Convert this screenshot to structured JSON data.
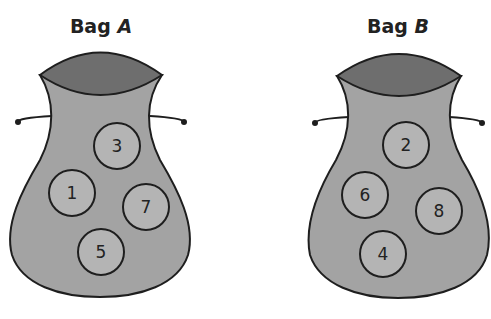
{
  "bags": [
    {
      "label_prefix": "Bag",
      "label_letter": "A",
      "marbles": [
        {
          "value": "3",
          "cx": 117,
          "cy": 146
        },
        {
          "value": "1",
          "cx": 72,
          "cy": 193
        },
        {
          "value": "7",
          "cx": 146,
          "cy": 207
        },
        {
          "value": "5",
          "cx": 101,
          "cy": 252
        }
      ]
    },
    {
      "label_prefix": "Bag",
      "label_letter": "B",
      "marbles": [
        {
          "value": "2",
          "cx": 406,
          "cy": 145
        },
        {
          "value": "6",
          "cx": 365,
          "cy": 195
        },
        {
          "value": "8",
          "cx": 439,
          "cy": 211
        },
        {
          "value": "4",
          "cx": 383,
          "cy": 254
        }
      ]
    }
  ],
  "colors": {
    "bag_body": "#a3a3a3",
    "bag_opening": "#6e6e6e",
    "marble": "#b4b4b4",
    "outline": "#1e1e1e"
  }
}
